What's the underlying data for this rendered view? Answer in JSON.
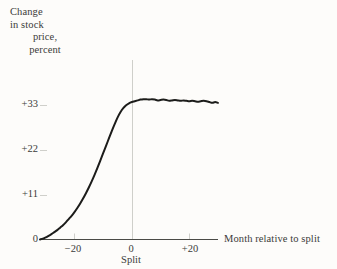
{
  "chart_data": {
    "type": "line",
    "title": "",
    "subtitle": "",
    "ylabel_lines": [
      "Change",
      "in stock",
      "price,",
      "percent"
    ],
    "ylabel": "Change in stock price, percent",
    "xlabel": "Month relative to split",
    "x_event_caption": "Split",
    "xlim": [
      -32,
      30
    ],
    "ylim": [
      0,
      40
    ],
    "grid": false,
    "event_line_x": 0,
    "legend": null,
    "yticks": [
      {
        "value": 0,
        "label": "0"
      },
      {
        "value": 11,
        "label": "+11"
      },
      {
        "value": 22,
        "label": "+22"
      },
      {
        "value": 33,
        "label": "+33"
      }
    ],
    "xticks": [
      {
        "value": -20,
        "label": "−20"
      },
      {
        "value": 0,
        "label": "0"
      },
      {
        "value": 20,
        "label": "+20"
      }
    ],
    "series": [
      {
        "name": "Cumulative abnormal return",
        "color": "#1c1c1a",
        "x": [
          -32,
          -31,
          -30,
          -29,
          -28,
          -27,
          -26,
          -25,
          -24,
          -23,
          -22,
          -21,
          -20,
          -19,
          -18,
          -17,
          -16,
          -15,
          -14,
          -13,
          -12,
          -11,
          -10,
          -9,
          -8,
          -7,
          -6,
          -5,
          -4,
          -3,
          -2,
          -1,
          0,
          1,
          2,
          3,
          4,
          5,
          6,
          7,
          8,
          9,
          10,
          11,
          12,
          13,
          14,
          15,
          16,
          17,
          18,
          19,
          20,
          21,
          22,
          23,
          24,
          25,
          26,
          27,
          28,
          29,
          30
        ],
        "values": [
          0.0,
          0.2,
          0.5,
          0.9,
          1.3,
          1.8,
          2.3,
          2.9,
          3.5,
          4.2,
          5.0,
          5.8,
          6.7,
          7.7,
          8.8,
          10.0,
          11.3,
          12.7,
          14.2,
          15.8,
          17.5,
          19.3,
          21.1,
          22.9,
          24.7,
          26.5,
          28.2,
          29.8,
          31.1,
          32.1,
          32.8,
          33.3,
          33.6,
          33.8,
          34.0,
          34.2,
          34.3,
          34.3,
          34.2,
          34.3,
          34.2,
          34.0,
          34.1,
          34.2,
          34.1,
          33.9,
          34.0,
          34.1,
          34.0,
          33.9,
          34.0,
          33.9,
          33.8,
          33.9,
          33.8,
          33.7,
          33.8,
          33.9,
          33.8,
          33.6,
          33.4,
          33.6,
          33.4
        ]
      }
    ]
  },
  "axes_style": {
    "axis_color": "#4a4a46",
    "gridline_color": "#cfcfca",
    "text_color": "#3b3b39",
    "background": "#fdfcfa"
  }
}
